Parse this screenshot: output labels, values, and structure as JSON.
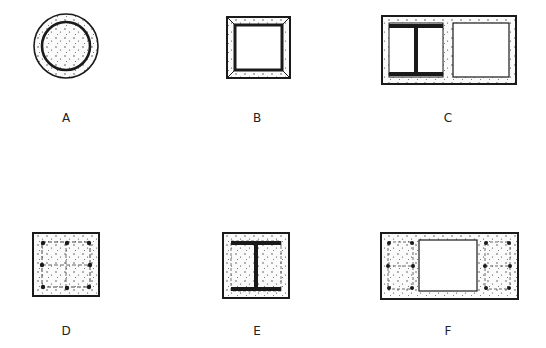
{
  "colors": {
    "stroke": "#1a1a1a",
    "fill": "#ffffff",
    "aggregate": "#333333"
  },
  "panels": [
    {
      "id": "A",
      "label": "A",
      "description": "Concrete-filled circular steel tube with concrete encasement"
    },
    {
      "id": "B",
      "label": "B",
      "description": "Square steel tube encased in concrete"
    },
    {
      "id": "C",
      "label": "C",
      "description": "Rectangular concrete section with encased I-section and hollow cell"
    },
    {
      "id": "D",
      "label": "D",
      "description": "Square reinforced concrete section with longitudinal bars and ties"
    },
    {
      "id": "E",
      "label": "E",
      "description": "Steel I-section encased in square concrete section"
    },
    {
      "id": "F",
      "label": "F",
      "description": "Rectangular concrete section with two reinforced cages and central hollow"
    }
  ]
}
